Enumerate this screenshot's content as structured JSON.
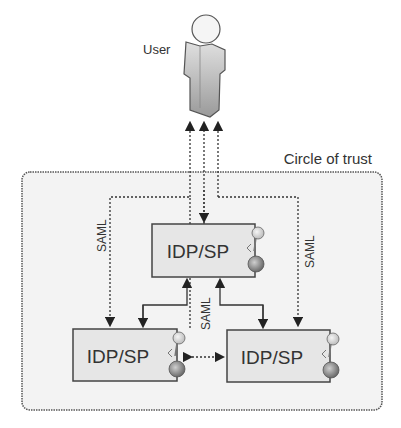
{
  "diagram": {
    "user_label": "User",
    "trust_label": "Circle of trust",
    "nodes": [
      {
        "id": "top",
        "label": "IDP/SP"
      },
      {
        "id": "bottom-left",
        "label": "IDP/SP"
      },
      {
        "id": "bottom-right",
        "label": "IDP/SP"
      }
    ],
    "edge_labels": {
      "left": "SAML",
      "right": "SAML",
      "center": "SAML"
    },
    "colors": {
      "box_fill": "#e6e6e6",
      "box_stroke": "#444444",
      "region_fill": "#f3f3f3",
      "line": "#333333"
    }
  }
}
